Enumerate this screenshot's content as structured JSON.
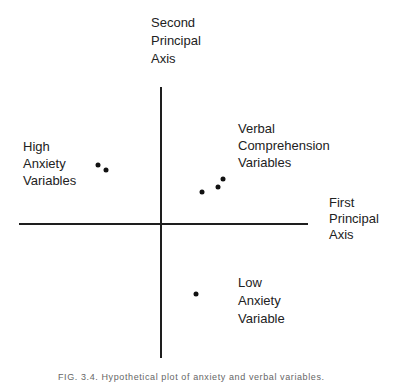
{
  "figure": {
    "axes": {
      "second_axis_label": [
        "Second",
        "Principal",
        "Axis"
      ],
      "first_axis_label": [
        "First",
        "Principal",
        "Axis"
      ]
    },
    "groups": [
      {
        "name": "High Anxiety Variables",
        "lines": [
          "High",
          "Anxiety",
          "Variables"
        ],
        "points": [
          [
            98,
            165
          ],
          [
            106,
            170
          ]
        ]
      },
      {
        "name": "Verbal Comprehension Variables",
        "lines": [
          "Verbal",
          "Comprehension",
          "Variables"
        ],
        "points": [
          [
            202,
            192
          ],
          [
            218,
            187
          ],
          [
            223,
            179
          ]
        ]
      },
      {
        "name": "Low Anxiety Variable",
        "lines": [
          "Low",
          "Anxiety",
          "Variable"
        ],
        "points": [
          [
            196,
            294
          ]
        ]
      }
    ],
    "caption": "FIG. 3.4. Hypothetical plot of anxiety and verbal variables."
  }
}
